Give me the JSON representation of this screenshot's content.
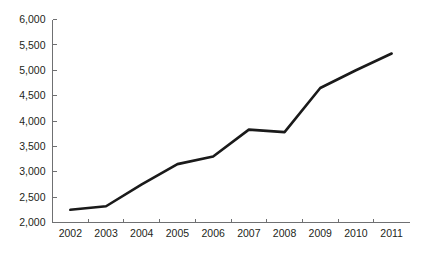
{
  "chart_data": {
    "type": "line",
    "title": "",
    "subtitle": "",
    "xlabel": "",
    "ylabel": "",
    "categories": [
      "2002",
      "2003",
      "2004",
      "2005",
      "2006",
      "2007",
      "2008",
      "2009",
      "2010",
      "2011"
    ],
    "x": [
      2002,
      2003,
      2004,
      2005,
      2006,
      2007,
      2008,
      2009,
      2010,
      2011
    ],
    "values": [
      2250,
      2320,
      2750,
      3150,
      3300,
      3830,
      3780,
      4650,
      5000,
      5330
    ],
    "series": [
      {
        "name": "",
        "values": [
          2250,
          2320,
          2750,
          3150,
          3300,
          3830,
          3780,
          4650,
          5000,
          5330
        ],
        "color": "#1a1a1a"
      }
    ],
    "ylim": [
      2000,
      6000
    ],
    "yticks": [
      2000,
      2500,
      3000,
      3500,
      4000,
      4500,
      5000,
      5500,
      6000
    ],
    "ytick_labels": [
      "2,000",
      "2,500",
      "3,000",
      "3,500",
      "4,000",
      "4,500",
      "5,000",
      "5,500",
      "6,000"
    ],
    "xtick_labels": [
      "2002",
      "2003",
      "2004",
      "2005",
      "2006",
      "2007",
      "2008",
      "2009",
      "2010",
      "2011"
    ],
    "grid": false,
    "legend": false,
    "legend_position": "none",
    "axis_color": "#6f7072",
    "line_color": "#1a1a1a",
    "background_color": "#ffffff"
  }
}
